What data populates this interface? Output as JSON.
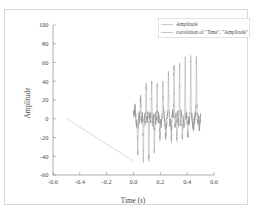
{
  "chart_data": {
    "type": "line",
    "title": "",
    "xlabel": "Time (s)",
    "ylabel": "Amplitude",
    "xlim": [
      -0.6,
      0.6
    ],
    "ylim": [
      -60,
      100
    ],
    "xticks": [
      "-0.6",
      "-0.4",
      "-0.2",
      "0.0",
      "0.2",
      "0.4",
      "0.6"
    ],
    "xtick_values": [
      -0.6,
      -0.4,
      -0.2,
      0.0,
      0.2,
      0.4,
      0.6
    ],
    "yticks": [
      "100",
      "80",
      "60",
      "40",
      "20",
      "0",
      "-20",
      "-40",
      "-60"
    ],
    "ytick_values": [
      100,
      80,
      60,
      40,
      20,
      0,
      -20,
      -40,
      -60
    ],
    "grid": false,
    "legend_position": "upper right",
    "legend": [
      {
        "label": "Amplitude",
        "color": "#b9b9b9"
      },
      {
        "label": "correlation of \"Time\", \"Amplitude\"",
        "color": "#9a9a9a"
      }
    ],
    "series": [
      {
        "name": "Amplitude",
        "color": "#b9b9b9",
        "description": "Linear descending ramp from (-0.5, 0) to (0.0, -45)",
        "x": [
          -0.5,
          -0.45,
          -0.4,
          -0.35,
          -0.3,
          -0.25,
          -0.2,
          -0.15,
          -0.1,
          -0.05,
          0.0
        ],
        "y": [
          0,
          -4.5,
          -9,
          -13.5,
          -18,
          -22.5,
          -27,
          -31.5,
          -36,
          -40.5,
          -45
        ]
      },
      {
        "name": "correlation of \"Time\", \"Amplitude\"",
        "color": "#9a9a9a",
        "description": "Noisy oscillating burst from x=0.0 to x=0.5 with a dense band near 0 and spikes growing from about -45/+18 up to -15/+78",
        "x_start": 0.0,
        "x_end": 0.5,
        "envelope_upper": [
          18,
          24,
          30,
          34,
          40,
          45,
          50,
          55,
          60,
          66,
          72,
          78
        ],
        "envelope_lower": [
          -45,
          -44,
          -40,
          -34,
          -28,
          -24,
          -21,
          -19,
          -17,
          -16,
          -15,
          -14
        ],
        "band_amplitude": 9,
        "spike_count": 12
      }
    ]
  }
}
